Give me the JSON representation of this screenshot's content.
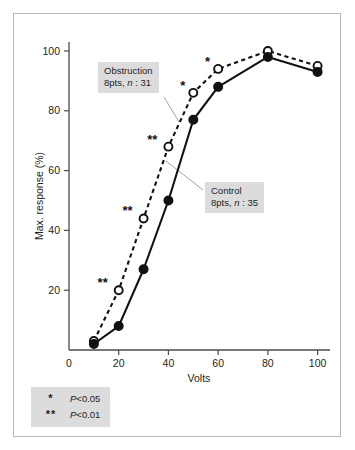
{
  "figure": {
    "background_color": "#ffffff",
    "frame_color": "#b9b9b9",
    "callout_bg_color": "#dcdcdc",
    "ink_color": "#111111"
  },
  "annotations": {
    "obstruction": {
      "line1": "Obstruction",
      "line2_prefix": "8pts, ",
      "line2_italic": "n",
      "line2_suffix": " : 31"
    },
    "control": {
      "line1": "Control",
      "line2_prefix": "8pts, ",
      "line2_italic": "n",
      "line2_suffix": " : 35"
    }
  },
  "legend_significance": {
    "rows": [
      {
        "symbol": "*",
        "italic": "P",
        "value": "<0.05"
      },
      {
        "symbol": "**",
        "italic": "P",
        "value": "<0.01"
      }
    ]
  },
  "chart_data": {
    "type": "line",
    "title": "",
    "xlabel": "Volts",
    "ylabel": "Max. response (%)",
    "xlim": [
      0,
      105
    ],
    "ylim": [
      0,
      103
    ],
    "xticks": [
      0,
      20,
      40,
      60,
      80,
      100
    ],
    "xtick_labels": [
      "0",
      "20",
      "40",
      "60",
      "80",
      "100"
    ],
    "yticks": [
      20,
      40,
      60,
      80,
      100
    ],
    "ytick_labels": [
      "20",
      "40",
      "60",
      "80",
      "100"
    ],
    "grid": false,
    "legend_position": "inline-callouts",
    "x": [
      10,
      20,
      30,
      40,
      50,
      60,
      80,
      100
    ],
    "series": [
      {
        "name": "Obstruction",
        "detail": "8pts, n : 31",
        "marker": "open-circle",
        "linestyle": "dashed",
        "values": [
          3,
          20,
          44,
          68,
          86,
          94,
          100,
          95
        ]
      },
      {
        "name": "Control",
        "detail": "8pts, n : 35",
        "marker": "filled-circle",
        "linestyle": "solid",
        "values": [
          2,
          8,
          27,
          50,
          77,
          88,
          98,
          93
        ]
      }
    ],
    "significance_markers": [
      {
        "x": 20,
        "y": 20,
        "symbol": "**"
      },
      {
        "x": 30,
        "y": 44,
        "symbol": "**"
      },
      {
        "x": 40,
        "y": 68,
        "symbol": "**"
      },
      {
        "x": 50,
        "y": 86,
        "symbol": "*"
      },
      {
        "x": 60,
        "y": 94,
        "symbol": "*"
      }
    ]
  }
}
